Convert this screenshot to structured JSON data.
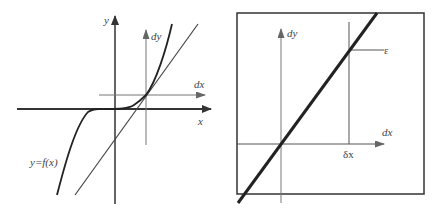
{
  "figure": {
    "left_panel": {
      "description": "Cubic-like curve y=f(x) with tangent line at a point; local dx/dy axes at the tangent point",
      "labels": {
        "y_axis": "y",
        "x_axis": "x",
        "dy_axis": "dy",
        "dx_axis": "dx",
        "curve": "y=f(x)"
      }
    },
    "right_panel": {
      "description": "Zoomed-in box showing the curve appearing as a straight line in the local dx/dy frame",
      "labels": {
        "dy_axis": "dy",
        "dx_axis": "dx",
        "delta_x": "δx",
        "epsilon": "ε"
      }
    },
    "colors": {
      "axis": "#555555",
      "curve": "#222222",
      "thin_line": "#444444",
      "frame": "#333333",
      "text": "#444444",
      "background": "#ffffff"
    }
  }
}
